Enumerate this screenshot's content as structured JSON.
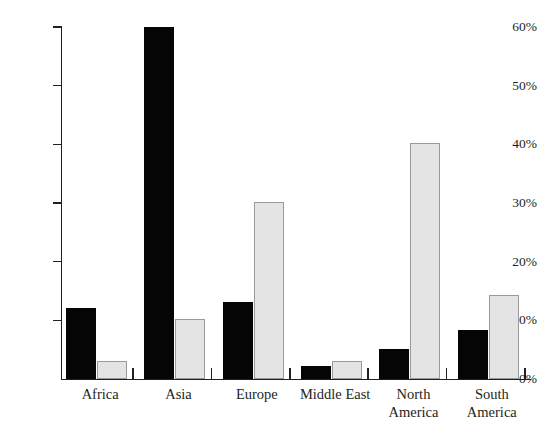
{
  "chart_data": {
    "type": "bar",
    "title": "",
    "subtitle": "",
    "xlabel": "",
    "ylabel": "",
    "ylim": [
      0,
      60
    ],
    "ytick_values": [
      0,
      10,
      20,
      30,
      40,
      50,
      60
    ],
    "ytick_labels": [
      "0%",
      "10%",
      "20%",
      "30%",
      "40%",
      "50%",
      "60%"
    ],
    "grid": false,
    "legend": "none",
    "value_suffix": "%",
    "categories": [
      "Africa",
      "Asia",
      "Europe",
      "Middle East",
      "North\nAmerica",
      "South\nAmerica"
    ],
    "series": [
      {
        "name": "series-dark",
        "color": "#050505",
        "values": [
          12.1,
          60.0,
          13.2,
          2.2,
          5.2,
          8.4
        ]
      },
      {
        "name": "series-light",
        "color": "#e4e4e4",
        "border_color": "#9a9a9a",
        "values": [
          3.0,
          10.2,
          30.1,
          3.1,
          40.3,
          14.3
        ]
      }
    ]
  },
  "axes": {
    "y_ticks": [
      {
        "label": "60%",
        "value": 60
      },
      {
        "label": "50%",
        "value": 50
      },
      {
        "label": "40%",
        "value": 40
      },
      {
        "label": "30%",
        "value": 30
      },
      {
        "label": "20%",
        "value": 20
      },
      {
        "label": "10%",
        "value": 10
      },
      {
        "label": "0%",
        "value": 0
      }
    ],
    "x_labels": [
      {
        "label": "Africa",
        "lines": [
          "Africa"
        ]
      },
      {
        "label": "Asia",
        "lines": [
          "Asia"
        ]
      },
      {
        "label": "Europe",
        "lines": [
          "Europe"
        ]
      },
      {
        "label": "Middle East",
        "lines": [
          "Middle East"
        ]
      },
      {
        "label": "North America",
        "lines": [
          "North",
          "America"
        ]
      },
      {
        "label": "South America",
        "lines": [
          "South",
          "America"
        ]
      }
    ]
  },
  "colors": {
    "dark_bar": "#050505",
    "light_bar": "#e4e4e4",
    "light_bar_border": "#9a9a9a",
    "axis": "#231f20",
    "background": "#ffffff",
    "text": "#231f20"
  }
}
